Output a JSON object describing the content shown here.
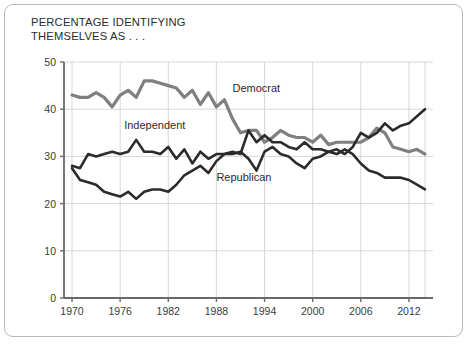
{
  "figure": {
    "title": "PERCENTAGE IDENTIFYING\nTHEMSELVES AS . . .",
    "background_color": "#ffffff",
    "frame_color": "#b9b9b9"
  },
  "chart_data": {
    "type": "line",
    "title": "PERCENTAGE IDENTIFYING THEMSELVES AS . . .",
    "xlabel": "",
    "ylabel": "",
    "xlim": [
      1969,
      2015
    ],
    "ylim": [
      0,
      50
    ],
    "grid": true,
    "legend_position": "inline-annotations",
    "xticks": [
      1970,
      1976,
      1982,
      1988,
      1994,
      2000,
      2006,
      2012
    ],
    "xtick_labels": [
      "1970",
      "1976",
      "1982",
      "1988",
      "1994",
      "2000",
      "2006",
      "2012"
    ],
    "yticks": [
      0,
      10,
      20,
      30,
      40,
      50
    ],
    "ytick_labels": [
      "0",
      "10",
      "20",
      "30",
      "40",
      "50"
    ],
    "x": [
      1970,
      1971,
      1972,
      1973,
      1974,
      1975,
      1976,
      1977,
      1978,
      1979,
      1980,
      1981,
      1982,
      1983,
      1984,
      1985,
      1986,
      1987,
      1988,
      1989,
      1990,
      1991,
      1992,
      1993,
      1994,
      1995,
      1996,
      1997,
      1998,
      1999,
      2000,
      2001,
      2002,
      2003,
      2004,
      2005,
      2006,
      2007,
      2008,
      2009,
      2010,
      2011,
      2012,
      2013,
      2014
    ],
    "series": [
      {
        "name": "Democrat",
        "color": "#7f7f7f",
        "line_width": 3.2,
        "values": [
          43,
          42.5,
          42.5,
          43.5,
          42.5,
          40.5,
          43,
          44,
          42.5,
          46,
          46,
          45.5,
          45,
          44.5,
          42.5,
          44,
          41,
          43.5,
          40.5,
          42,
          38,
          35,
          35.5,
          35.5,
          33,
          34,
          35.5,
          34.5,
          34,
          34,
          33,
          34.5,
          32.5,
          33,
          33,
          33,
          33,
          34,
          36,
          35,
          32,
          31.5,
          31,
          31.5,
          30.5
        ],
        "label_x": 1990,
        "label_y": 43.7
      },
      {
        "name": "Independent",
        "color": "#2b2b2b",
        "line_width": 2.6,
        "values": [
          28,
          27.5,
          30.5,
          30,
          30.5,
          31,
          30.5,
          31,
          33.5,
          31,
          31,
          30.5,
          32,
          29.5,
          31.5,
          28.5,
          31,
          29.5,
          30.5,
          30.5,
          31,
          30.5,
          35.5,
          33,
          34.5,
          33,
          33,
          32,
          31.5,
          33,
          31.5,
          31.5,
          31,
          31.5,
          30.5,
          32,
          35,
          34,
          35,
          37,
          35.5,
          36.5,
          37,
          38.5,
          40
        ],
        "label_x": 1976.5,
        "label_y": 35.8
      },
      {
        "name": "Republican",
        "color": "#2b2b2b",
        "line_width": 2.6,
        "values": [
          27.5,
          25,
          24.5,
          24,
          22.5,
          22,
          21.5,
          22.5,
          21,
          22.5,
          23,
          23,
          22.5,
          24,
          26,
          27,
          28,
          26.5,
          29,
          30.5,
          30.5,
          31,
          29.5,
          27,
          31,
          32,
          30.5,
          30,
          28.5,
          27.5,
          29.5,
          30,
          31,
          30.5,
          31.5,
          30.5,
          28.5,
          27,
          26.5,
          25.5,
          25.5,
          25.5,
          25,
          24,
          23
        ],
        "label_x": 1988,
        "label_y": 24.8
      }
    ]
  },
  "labels": {
    "democrat": "Democrat",
    "independent": "Independent",
    "republican": "Republican"
  }
}
